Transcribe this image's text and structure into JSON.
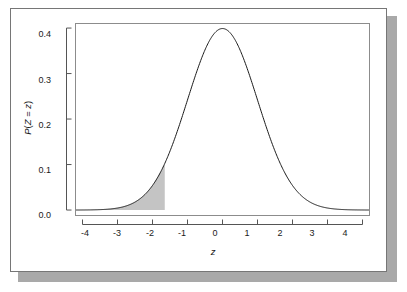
{
  "figure": {
    "background_color": "#ffffff",
    "frame_border_color": "#767676",
    "shadow_color": "#a9a9a9"
  },
  "chart_data": {
    "type": "area",
    "title": "",
    "subtitle": "",
    "xlabel": "z",
    "ylabel": "P(Z = z)",
    "xlim": [
      -4.2,
      4.2
    ],
    "ylim": [
      -0.012,
      0.41
    ],
    "grid": false,
    "legend": null,
    "curve_color": "#1a1a1a",
    "shade_color": "#c4c4c4",
    "axis_color": "#555555",
    "x_ticks": [
      -4,
      -3,
      -2,
      -1,
      0,
      1,
      2,
      3,
      4
    ],
    "x_tick_labels": [
      "-4",
      "-3",
      "-2",
      "-1",
      "0",
      "1",
      "2",
      "3",
      "4"
    ],
    "y_ticks": [
      0.0,
      0.1,
      0.2,
      0.3,
      0.4
    ],
    "y_tick_labels": [
      "0.0",
      "0.1",
      "0.2",
      "0.3",
      "0.4"
    ],
    "distribution": "standard normal density",
    "mean": 0,
    "sd": 1,
    "peak_value": 0.3989,
    "shaded_region": {
      "from": -4.2,
      "to": -1.65,
      "description": "left tail shaded from minus infinity to z = -1.65",
      "area": 0.0495
    },
    "series": [
      {
        "name": "standard normal density",
        "x": [
          -4.2,
          -4.0,
          -3.8,
          -3.6,
          -3.4,
          -3.2,
          -3.0,
          -2.8,
          -2.6,
          -2.4,
          -2.2,
          -2.0,
          -1.8,
          -1.65,
          -1.6,
          -1.4,
          -1.2,
          -1.0,
          -0.8,
          -0.6,
          -0.4,
          -0.2,
          0.0,
          0.2,
          0.4,
          0.6,
          0.8,
          1.0,
          1.2,
          1.4,
          1.6,
          1.8,
          2.0,
          2.2,
          2.4,
          2.6,
          2.8,
          3.0,
          3.2,
          3.4,
          3.6,
          3.8,
          4.0,
          4.2
        ],
        "y": [
          0.0001,
          0.0001,
          0.0003,
          0.0006,
          0.0012,
          0.0024,
          0.0044,
          0.0079,
          0.0136,
          0.0224,
          0.0355,
          0.054,
          0.079,
          0.1023,
          0.1109,
          0.1497,
          0.1942,
          0.242,
          0.2897,
          0.3332,
          0.3683,
          0.391,
          0.3989,
          0.391,
          0.3683,
          0.3332,
          0.2897,
          0.242,
          0.1942,
          0.1497,
          0.1109,
          0.079,
          0.054,
          0.0355,
          0.0224,
          0.0136,
          0.0079,
          0.0044,
          0.0024,
          0.0012,
          0.0006,
          0.0003,
          0.0001,
          0.0001
        ]
      }
    ]
  }
}
